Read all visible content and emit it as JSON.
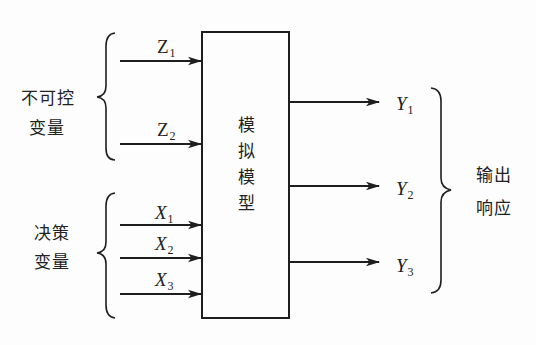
{
  "diagram": {
    "center_box": {
      "label_chars": [
        "模",
        "拟",
        "模",
        "型"
      ],
      "label": "模拟模型"
    },
    "groups": {
      "uncontrollable": {
        "line1": "不可控",
        "line2": "变量",
        "label": "不可控变量"
      },
      "decision": {
        "line1": "决策",
        "line2": "变量",
        "label": "决策变量"
      },
      "output": {
        "line1": "输出",
        "line2": "响应",
        "label": "输出响应"
      }
    },
    "inputs": [
      {
        "id": "Z1",
        "base": "Z",
        "sub": "1",
        "italic": false,
        "group": "uncontrollable"
      },
      {
        "id": "Z2",
        "base": "Z",
        "sub": "2",
        "italic": false,
        "group": "uncontrollable"
      },
      {
        "id": "X1",
        "base": "X",
        "sub": "1",
        "italic": true,
        "group": "decision"
      },
      {
        "id": "X2",
        "base": "X",
        "sub": "2",
        "italic": true,
        "group": "decision"
      },
      {
        "id": "X3",
        "base": "X",
        "sub": "3",
        "italic": true,
        "group": "decision"
      }
    ],
    "outputs": [
      {
        "id": "Y1",
        "base": "Y",
        "sub": "1",
        "italic": true
      },
      {
        "id": "Y2",
        "base": "Y",
        "sub": "2",
        "italic": true
      },
      {
        "id": "Y3",
        "base": "Y",
        "sub": "3",
        "italic": true
      }
    ],
    "colors": {
      "stroke": "#1e1e1e",
      "text": "#222222",
      "background": "#fdfdfd"
    }
  }
}
